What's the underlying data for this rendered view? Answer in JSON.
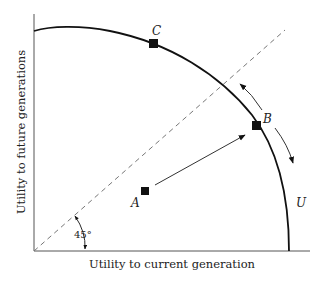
{
  "diagram": {
    "xlabel": "Utility to current generation",
    "ylabel": "Utility to future generations",
    "angle_label": "45°",
    "curve_label": "U",
    "points": [
      {
        "label": "A",
        "x": 145,
        "y": 191
      },
      {
        "label": "B",
        "x": 257,
        "y": 125
      },
      {
        "label": "C",
        "x": 153,
        "y": 43
      }
    ]
  }
}
